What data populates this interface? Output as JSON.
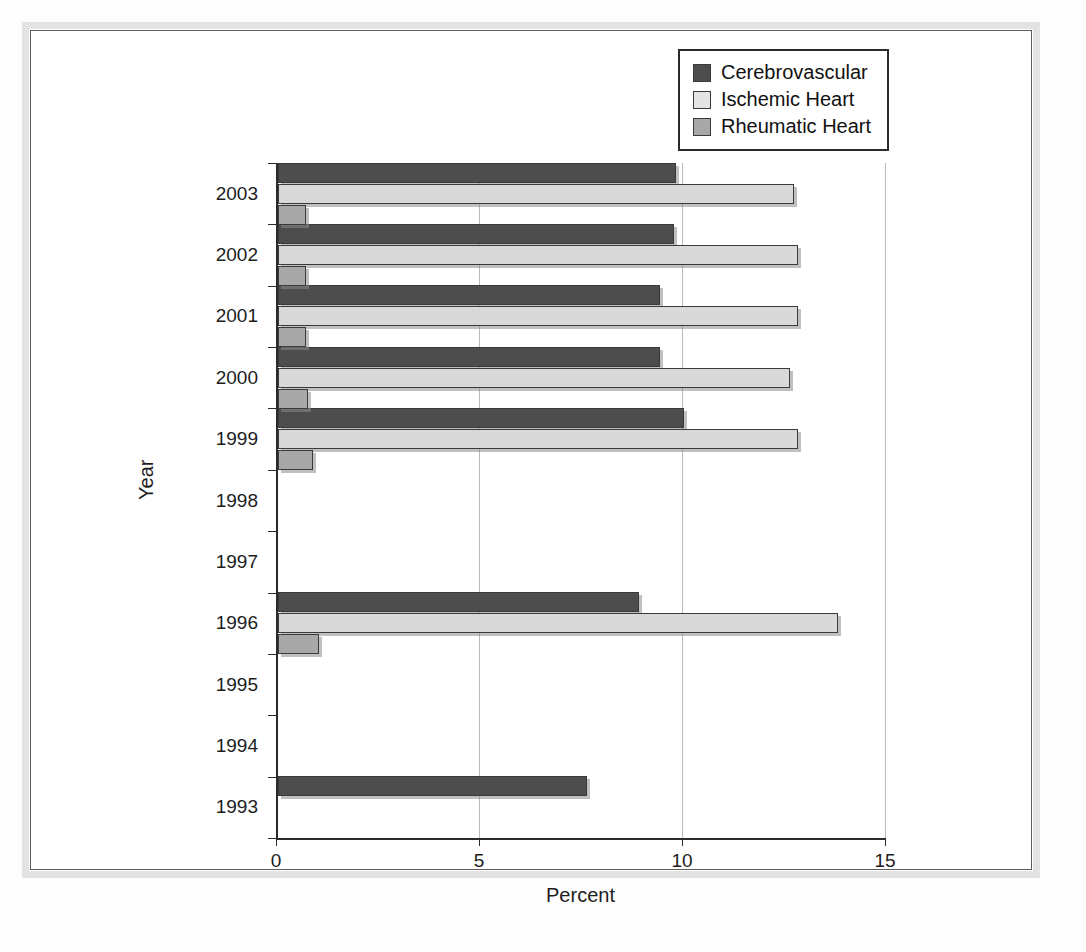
{
  "chart_data": {
    "type": "bar",
    "orientation": "horizontal",
    "title": "",
    "xlabel": "Percent",
    "ylabel": "Year",
    "xlim": [
      0,
      15
    ],
    "xticks": [
      0,
      5,
      10,
      15
    ],
    "xtick_labels": [
      "0",
      "5",
      "10",
      "15"
    ],
    "categories": [
      "1993",
      "1994",
      "1995",
      "1996",
      "1997",
      "1998",
      "1999",
      "2000",
      "2001",
      "2002",
      "2003"
    ],
    "grid": "vertical",
    "legend_position": "top-right",
    "series": [
      {
        "name": "Cerebrovascular",
        "color": "#4d4d4d",
        "values": [
          7.6,
          0,
          0,
          8.9,
          0,
          0,
          10.0,
          9.4,
          9.4,
          9.75,
          9.8
        ]
      },
      {
        "name": "Ischemic Heart",
        "color": "#d9d9d9",
        "values": [
          0,
          0,
          0,
          13.8,
          0,
          0,
          12.8,
          12.6,
          12.8,
          12.8,
          12.7
        ]
      },
      {
        "name": "Rheumatic Heart",
        "color": "#a8a8a8",
        "values": [
          0,
          0,
          0,
          1.0,
          0,
          0,
          0.85,
          0.75,
          0.7,
          0.7,
          0.7
        ]
      }
    ]
  },
  "legend": {
    "items": [
      {
        "label": "Cerebrovascular",
        "swatch": "cerebro"
      },
      {
        "label": "Ischemic Heart",
        "swatch": "ischemic"
      },
      {
        "label": "Rheumatic Heart",
        "swatch": "rheumatic"
      }
    ]
  },
  "axes": {
    "x_title": "Percent",
    "y_title": "Year"
  }
}
